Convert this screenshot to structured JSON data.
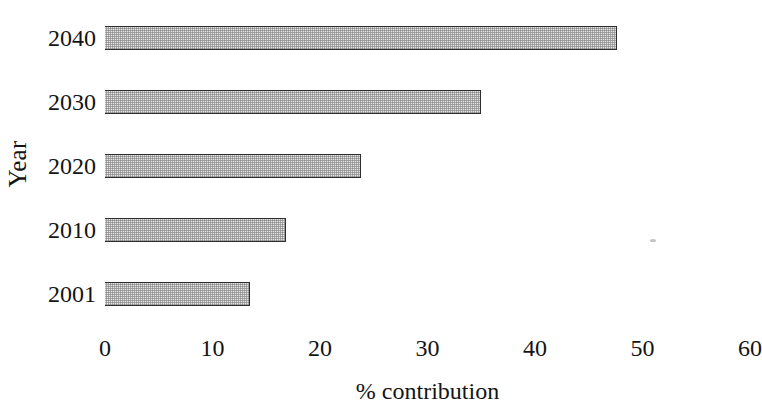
{
  "chart_data": {
    "type": "bar",
    "orientation": "horizontal",
    "title": "",
    "xlabel": "% contribution",
    "ylabel": "Year",
    "categories": [
      "2001",
      "2010",
      "2020",
      "2030",
      "2040"
    ],
    "values": [
      13.5,
      16.8,
      23.8,
      35.0,
      47.6
    ],
    "series": [
      {
        "name": "% contribution",
        "values": [
          13.5,
          16.8,
          23.8,
          35.0,
          47.6
        ]
      }
    ],
    "xlim": [
      0,
      60
    ],
    "xticks": [
      "0",
      "10",
      "20",
      "30",
      "40",
      "50",
      "60"
    ],
    "xtick_values": [
      0,
      10,
      20,
      30,
      40,
      50,
      60
    ],
    "ytick_labels": [
      "2001",
      "2010",
      "2020",
      "2030",
      "2040"
    ],
    "grid": false,
    "legend": false,
    "legend_position": "none",
    "bar_fill": "#e4e4e4",
    "bar_edge": "#2e2e2e",
    "axis_color": "#2b2b2b",
    "text_color": "#141414",
    "background": "#ffffff"
  }
}
